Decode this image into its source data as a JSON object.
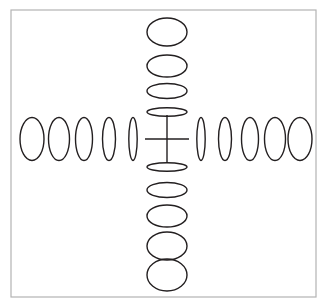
{
  "figure": {
    "background_color": "#ffffff",
    "stroke_color": "#231f20",
    "frame_color": "#b3b3b3",
    "frame": {
      "x": 11,
      "y": 10,
      "width": 305,
      "height": 287,
      "stroke_width": 1.2
    },
    "center": {
      "x": 167,
      "y": 139
    },
    "cross": {
      "name": "degenerate-ellipse-cross",
      "half_width": 22,
      "half_height": 24,
      "stroke_width": 1.4
    },
    "stroke_width": 1.4,
    "horizontal_ellipses": [
      {
        "index": 1,
        "cx": 32,
        "cy": 139,
        "rx": 12.0,
        "ry": 21.5
      },
      {
        "index": 2,
        "cx": 59,
        "cy": 139,
        "rx": 10.5,
        "ry": 21.5
      },
      {
        "index": 3,
        "cx": 84,
        "cy": 139,
        "rx": 8.5,
        "ry": 21.5
      },
      {
        "index": 4,
        "cx": 109,
        "cy": 139,
        "rx": 6.5,
        "ry": 21.5
      },
      {
        "index": 5,
        "cx": 133,
        "cy": 139,
        "rx": 4.2,
        "ry": 21.5
      },
      {
        "index": 6,
        "cx": 201,
        "cy": 139,
        "rx": 4.2,
        "ry": 21.5
      },
      {
        "index": 7,
        "cx": 225,
        "cy": 139,
        "rx": 6.5,
        "ry": 21.5
      },
      {
        "index": 8,
        "cx": 250,
        "cy": 139,
        "rx": 8.5,
        "ry": 21.5
      },
      {
        "index": 9,
        "cx": 275,
        "cy": 139,
        "rx": 10.5,
        "ry": 21.5
      },
      {
        "index": 10,
        "cx": 300,
        "cy": 139,
        "rx": 12.0,
        "ry": 21.5
      }
    ],
    "vertical_ellipses": [
      {
        "index": 1,
        "cx": 167,
        "cy": 32,
        "rx": 20.0,
        "ry": 14.0
      },
      {
        "index": 2,
        "cx": 167,
        "cy": 66,
        "rx": 20.0,
        "ry": 11.0
      },
      {
        "index": 3,
        "cx": 167,
        "cy": 91,
        "rx": 20.0,
        "ry": 7.5
      },
      {
        "index": 4,
        "cx": 167,
        "cy": 112,
        "rx": 20.0,
        "ry": 4.2
      },
      {
        "index": 5,
        "cx": 167,
        "cy": 167,
        "rx": 20.0,
        "ry": 4.2
      },
      {
        "index": 6,
        "cx": 167,
        "cy": 190,
        "rx": 20.0,
        "ry": 7.5
      },
      {
        "index": 7,
        "cx": 167,
        "cy": 216,
        "rx": 20.0,
        "ry": 11.0
      },
      {
        "index": 8,
        "cx": 167,
        "cy": 246,
        "rx": 20.0,
        "ry": 14.0
      },
      {
        "index": 9,
        "cx": 167,
        "cy": 275,
        "rx": 20.0,
        "ry": 16.0
      }
    ]
  }
}
